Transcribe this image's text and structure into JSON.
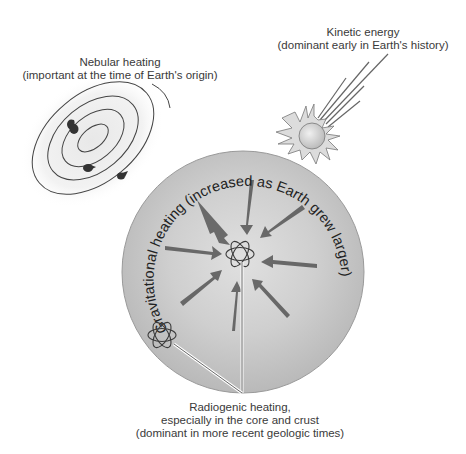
{
  "diagram": {
    "nebular": {
      "title": "Nebular heating",
      "note": "(important at the time of Earth's origin)"
    },
    "kinetic": {
      "title": "Kinetic energy",
      "note": "(dominant early in Earth's history)"
    },
    "gravitational": {
      "arc_text": "Gravitational heating (increased as Earth grew larger)"
    },
    "radiogenic": {
      "line1": "Radiogenic heating,",
      "line2": "especially in the core and crust",
      "line3": "(dominant in more recent geologic times)"
    },
    "elements": {
      "earth_sphere": "sphere",
      "arrows_count": 8,
      "atom_icons": 2,
      "nebula_orbits": 4,
      "nebula_particles": 3,
      "meteor_streaks": 5
    },
    "colors": {
      "sphere_fill": "#c9c9c9",
      "sphere_edge": "#9a9a9a",
      "arrow": "#5a5a5a",
      "line": "#444444",
      "text": "#3a3a3a"
    }
  }
}
